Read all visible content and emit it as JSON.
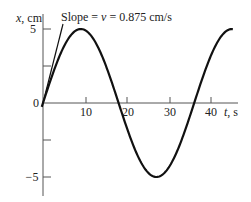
{
  "chart_data": {
    "type": "line",
    "title": "",
    "xlabel": "t, s",
    "ylabel": "x, cm",
    "xlim": [
      0,
      45
    ],
    "ylim": [
      -6,
      6
    ],
    "x_ticks": [
      10,
      20,
      30,
      40
    ],
    "x_tick_labels": [
      "10",
      "20",
      "30",
      "40"
    ],
    "y_ticks": [
      -5,
      -2.5,
      0,
      2.5,
      5
    ],
    "y_tick_labels": [
      "−5",
      "",
      "0",
      "",
      "5"
    ],
    "grid": false,
    "series": [
      {
        "name": "x(t) = 5 sin(2πt/36)",
        "amplitude_cm": 5,
        "period_s": 36,
        "x": [
          0,
          4.5,
          9,
          13.5,
          18,
          22.5,
          27,
          31.5,
          36,
          40.5,
          45
        ],
        "values": [
          0,
          3.54,
          5,
          3.54,
          0,
          -3.54,
          -5,
          -3.54,
          0,
          3.54,
          5
        ]
      }
    ],
    "annotations": [
      {
        "text": "Slope = v = 0.875 cm/s",
        "type": "tangent line at t=0",
        "slope": 0.875
      }
    ],
    "colors": {
      "curve": "#111111",
      "axes": "#555555",
      "text": "#222222"
    }
  },
  "labels": {
    "y_axis": "x, cm",
    "x_axis": "t, s",
    "slope_prefix": "Slope = ",
    "slope_v": "v",
    "slope_suffix": " = 0.875 cm/s",
    "y5": "5",
    "y0": "0",
    "yneg5": "−5",
    "x10": "10",
    "x20": "20",
    "x30": "30",
    "x40": "40"
  }
}
